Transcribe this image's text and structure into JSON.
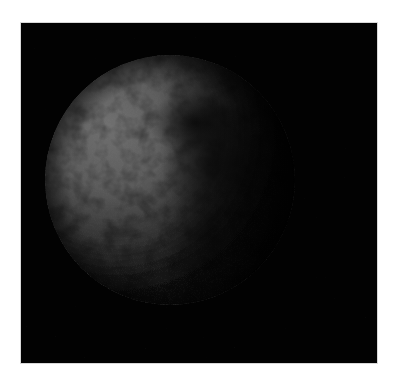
{
  "image": {
    "subject": "planetary body (sphere) lit from upper left, halftone print",
    "background_color": "#ffffff",
    "frame_color": "#020202",
    "sphere": {
      "center_x": 149,
      "center_y": 157,
      "radius": 125,
      "lit_color": "#6a6a6a",
      "mid_color": "#3a3a3a",
      "shadow_color": "#050505",
      "dark_region_color": "#1e1e1e"
    }
  }
}
